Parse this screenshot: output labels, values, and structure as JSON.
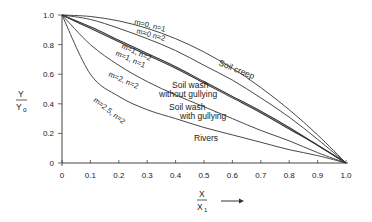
{
  "chart_data": {
    "type": "line",
    "title": "",
    "xlabel": "X / X1",
    "ylabel": "Y / Yo",
    "xlim": [
      0,
      1.0
    ],
    "ylim": [
      0,
      1.0
    ],
    "grid": false,
    "legend": "inline labels",
    "x_ticks": [
      "0",
      "0.1",
      "0.2",
      "0.3",
      "0.4",
      "0.5",
      "0.6",
      "0.7",
      "0.8",
      "0.9",
      "1.0"
    ],
    "y_ticks": [
      "0",
      "0.2",
      "0.4",
      "0.6",
      "0.8",
      "1.0"
    ],
    "x": [
      0,
      0.1,
      0.2,
      0.3,
      0.4,
      0.5,
      0.6,
      0.7,
      0.8,
      0.9,
      1.0
    ],
    "series": [
      {
        "name": "m=0, n=1",
        "process": "Soil creep",
        "values": [
          1.0,
          0.99,
          0.96,
          0.91,
          0.84,
          0.75,
          0.64,
          0.51,
          0.36,
          0.19,
          0.0
        ]
      },
      {
        "name": "m=0 n=2",
        "process": "Soil creep",
        "values": [
          1.0,
          0.97,
          0.91,
          0.84,
          0.76,
          0.66,
          0.56,
          0.44,
          0.31,
          0.16,
          0.0
        ]
      },
      {
        "name": "m=1, n=2",
        "process": "Soil wash without gullying",
        "values": [
          1.0,
          0.92,
          0.83,
          0.74,
          0.65,
          0.55,
          0.45,
          0.35,
          0.24,
          0.12,
          0.0
        ]
      },
      {
        "name": "m=1, n=1",
        "process": "Soil wash without gullying",
        "values": [
          1.0,
          0.91,
          0.82,
          0.73,
          0.64,
          0.54,
          0.44,
          0.34,
          0.23,
          0.12,
          0.0
        ]
      },
      {
        "name": "m=2, n=2",
        "process": "Soil wash with gullying",
        "values": [
          1.0,
          0.8,
          0.66,
          0.55,
          0.46,
          0.38,
          0.3,
          0.22,
          0.15,
          0.07,
          0.0
        ]
      },
      {
        "name": "m=2.5, n=2",
        "process": "Rivers",
        "values": [
          1.0,
          0.6,
          0.45,
          0.36,
          0.3,
          0.24,
          0.19,
          0.14,
          0.09,
          0.05,
          0.0
        ]
      }
    ],
    "annotations": [
      "Soil creep",
      "Soil wash without gullying",
      "Soil wash with gullying",
      "Rivers"
    ]
  },
  "labels": {
    "x_num": "X",
    "x_den": "X",
    "x_den_sub": "1",
    "y_num": "Y",
    "y_den": "Y",
    "y_den_sub": "o",
    "arrow": "→"
  },
  "curve_labels": {
    "m0n1": "m=0, n=1",
    "m0n2": "m=0 n=2",
    "m1n2": "m=1, n=2",
    "m1n1": "m=1, n=1",
    "m2n2": "m=2, n=2",
    "m25n2": "m=2.5, n=2"
  },
  "process_labels": {
    "creep": "Soil creep",
    "wash1a": "Soil wash",
    "wash1b": "without gullying",
    "wash2a": "Soil wash",
    "wash2b": "with gullying",
    "rivers": "Rivers"
  },
  "style": {
    "line_color": "#333333",
    "axis_color": "#444444",
    "background": "#ffffff"
  }
}
